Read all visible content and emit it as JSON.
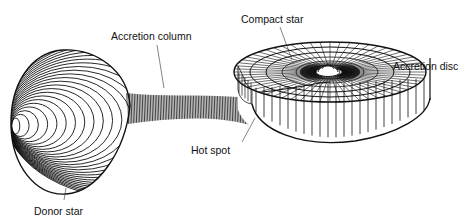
{
  "labels": {
    "accretion_column": "Accretion column",
    "compact_star": "Compact star",
    "accretion_disc": "Accretion disc",
    "hot_spot": "Hot spot",
    "donor_star": "Donor star"
  },
  "components": [
    {
      "name": "Donor star",
      "shape": "tear-drop lobe with concentric contour lines"
    },
    {
      "name": "Accretion column",
      "shape": "tapering hatched stream from donor to disc"
    },
    {
      "name": "Accretion disc",
      "shape": "thick ring with radial and concentric gridlines"
    },
    {
      "name": "Compact star",
      "shape": "small central bump in disc"
    },
    {
      "name": "Hot spot",
      "shape": "impact point of stream on disc edge"
    }
  ],
  "colors": {
    "line": "#111111",
    "background": "#ffffff"
  }
}
